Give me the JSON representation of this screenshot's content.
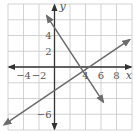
{
  "chart_data": {
    "type": "line",
    "title": "",
    "xlabel": "x",
    "ylabel": "y",
    "xlim": [
      -6,
      10
    ],
    "ylim": [
      -8,
      8
    ],
    "grid": true,
    "grid_step": 2,
    "x_tick_labels": [
      "-4",
      "-2",
      "4",
      "6",
      "8"
    ],
    "y_tick_labels": [
      "4",
      "2",
      "-6"
    ],
    "series": [
      {
        "name": "line-1",
        "equation": "y = -1.5x + 5",
        "slope": -1.5,
        "intercept": 5,
        "x": [
          -1,
          6.3
        ],
        "y": [
          6.5,
          -4.45
        ],
        "arrows": "both"
      },
      {
        "name": "line-2",
        "equation": "y = (2/3)x - 3",
        "slope": 0.6667,
        "intercept": -3,
        "x": [
          -6.5,
          9.7
        ],
        "y": [
          -7.33,
          3.47
        ],
        "arrows": "both"
      }
    ],
    "colors": {
      "lines": "#6b6b6b",
      "axes": "#333333",
      "grid": "#c8c8c8"
    }
  },
  "labels": {
    "x_axis": "x",
    "y_axis": "y",
    "x_ticks": [
      {
        "value": -4,
        "text": "−4"
      },
      {
        "value": -2,
        "text": "−2"
      },
      {
        "value": 4,
        "text": "4"
      },
      {
        "value": 6,
        "text": "6"
      },
      {
        "value": 8,
        "text": "8"
      }
    ],
    "y_ticks": [
      {
        "value": 4,
        "text": "4"
      },
      {
        "value": 2,
        "text": "2"
      },
      {
        "value": -6,
        "text": "−6"
      }
    ]
  }
}
